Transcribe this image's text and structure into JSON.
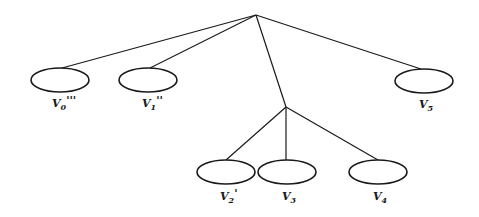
{
  "diagram": {
    "type": "tree",
    "root": {
      "x": 256,
      "y": 15
    },
    "internal_node": {
      "x": 286,
      "y": 107
    },
    "leaves": [
      {
        "id": "v0",
        "base": "V",
        "sub": "0",
        "primes": "'''",
        "cx": 60,
        "cy": 80,
        "rx": 29,
        "ry": 12,
        "parent": "root"
      },
      {
        "id": "v1",
        "base": "V",
        "sub": "1",
        "primes": "''",
        "cx": 148,
        "cy": 80,
        "rx": 29,
        "ry": 12,
        "parent": "root"
      },
      {
        "id": "v5",
        "base": "V",
        "sub": "5",
        "primes": "",
        "cx": 424,
        "cy": 81,
        "rx": 29,
        "ry": 12,
        "parent": "root"
      },
      {
        "id": "v2",
        "base": "V",
        "sub": "2",
        "primes": "'",
        "cx": 226,
        "cy": 172,
        "rx": 29,
        "ry": 12,
        "parent": "internal"
      },
      {
        "id": "v3",
        "base": "V",
        "sub": "3",
        "primes": "",
        "cx": 287,
        "cy": 172,
        "rx": 29,
        "ry": 12,
        "parent": "internal"
      },
      {
        "id": "v4",
        "base": "V",
        "sub": "4",
        "primes": "",
        "cx": 378,
        "cy": 172,
        "rx": 29,
        "ry": 12,
        "parent": "internal"
      }
    ],
    "labels": {
      "v0": {
        "base": "V",
        "sub": "0",
        "primes": "'''"
      },
      "v1": {
        "base": "V",
        "sub": "1",
        "primes": "''"
      },
      "v5": {
        "base": "V",
        "sub": "5",
        "primes": ""
      },
      "v2": {
        "base": "V",
        "sub": "2",
        "primes": "'"
      },
      "v3": {
        "base": "V",
        "sub": "3",
        "primes": ""
      },
      "v4": {
        "base": "V",
        "sub": "4",
        "primes": ""
      }
    },
    "colors": {
      "stroke": "#1a1a1a",
      "background": "#ffffff"
    }
  }
}
